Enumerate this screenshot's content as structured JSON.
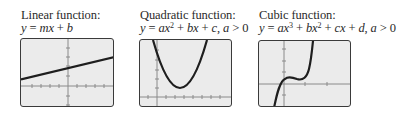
{
  "panels": [
    {
      "id": "linear",
      "title": "Linear function:",
      "formula_parts": {
        "y": "y",
        "eq": " = ",
        "m": "mx",
        "plus": " + ",
        "b": "b"
      },
      "formula_text": "y = mx + b"
    },
    {
      "id": "quadratic",
      "title": "Quadratic function:",
      "formula_parts": {
        "y": "y",
        "eq": " = ",
        "a": "ax",
        "exp2": "2",
        "plus1": " + ",
        "b": "bx",
        "plus2": " + ",
        "c": "c",
        "comma": ", ",
        "a2": "a",
        "gt": " > 0"
      },
      "formula_text": "y = ax² + bx + c, a > 0"
    },
    {
      "id": "cubic",
      "title": "Cubic function:",
      "formula_parts": {
        "y": "y",
        "eq": " = ",
        "a": "ax",
        "exp3": "3",
        "plus1": " + ",
        "b": "bx",
        "exp2": "2",
        "plus2": " + ",
        "c": "cx",
        "plus3": " + ",
        "d": "d",
        "comma": ", ",
        "a2": "a",
        "gt": " > 0"
      },
      "formula_text": "y = ax³ + bx² + cx + d, a > 0"
    }
  ],
  "colors": {
    "screen_background": "#ebebeb",
    "screen_border": "#3a3a3a",
    "axis": "#8a8a8a",
    "curve": "#1e1e1e",
    "text": "#2a2a2a"
  }
}
